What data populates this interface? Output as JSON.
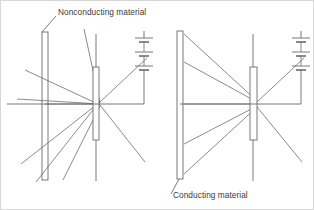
{
  "figure": {
    "title_label_top": "Nonconducting material",
    "title_label_bottom": "Conducting material",
    "line_color": "#59595b",
    "plate_color": "#6a6a6c",
    "text_color": "#3a3a3a",
    "background": "#ffffff"
  },
  "annotations": {
    "top": {
      "text": "Nonconducting material",
      "x": 57,
      "y": 12,
      "leader_from_x": 55,
      "leader_from_y": 15,
      "leader_to_x": 41,
      "leader_to_y": 31
    },
    "bottom": {
      "text": "Conducting material",
      "x": 172,
      "y": 197,
      "leader_from_x": 170,
      "leader_from_y": 193,
      "leader_to_x": 177,
      "leader_to_y": 178
    }
  },
  "panels": [
    {
      "name": "nonconducting-panel",
      "plate_type": "nonconducting",
      "plate_label": "Nonconducting material",
      "field_lines_pass_through": true,
      "slab": {
        "x": 41,
        "y": 31,
        "width": 6,
        "height": 148
      },
      "aperture_plate": {
        "x": 92,
        "y": 66,
        "width": 6,
        "height": 73
      },
      "aperture_stem_top": {
        "x": 95,
        "y": 33,
        "y2": 66
      },
      "aperture_stem_bottom": {
        "x": 95,
        "y": 139,
        "y2": 180
      },
      "wire": {
        "x1": 44,
        "y1": 103,
        "x2": 143,
        "y2": 103,
        "drop_x": 143,
        "drop_y2": 79
      },
      "battery": {
        "x": 140,
        "y_top": 37,
        "y_bottom": 79,
        "cells": 3
      },
      "field_lines": [
        {
          "x1": 35,
          "y1": 181,
          "x2": 99,
          "y2": 100
        },
        {
          "x1": 20,
          "y1": 163,
          "x2": 99,
          "y2": 101
        },
        {
          "x1": 16,
          "y1": 98,
          "x2": 99,
          "y2": 103
        },
        {
          "x1": 24,
          "y1": 69,
          "x2": 99,
          "y2": 104
        },
        {
          "x1": 62,
          "y1": 179,
          "x2": 99,
          "y2": 105
        },
        {
          "x1": 83,
          "y1": 28,
          "x2": 99,
          "y2": 102
        },
        {
          "x1": 99,
          "y1": 101,
          "x2": 146,
          "y2": 57
        },
        {
          "x1": 99,
          "y1": 104,
          "x2": 144,
          "y2": 161
        }
      ]
    },
    {
      "name": "conducting-panel",
      "plate_type": "conducting",
      "plate_label": "Conducting material",
      "field_lines_pass_through": false,
      "slab": {
        "x": 176,
        "y": 30,
        "width": 6,
        "height": 148
      },
      "aperture_plate": {
        "x": 249,
        "y": 66,
        "width": 7,
        "height": 73
      },
      "aperture_stem_top": {
        "x": 252,
        "y": 33,
        "y2": 66
      },
      "aperture_stem_bottom": {
        "x": 252,
        "y": 139,
        "y2": 180
      },
      "wire": {
        "x1": 179,
        "y1": 103,
        "x2": 300,
        "y2": 103,
        "drop_x": 300,
        "drop_y2": 79
      },
      "battery": {
        "x": 297,
        "y_top": 37,
        "y_bottom": 79,
        "cells": 3
      },
      "field_lines": [
        {
          "x1": 183,
          "y1": 33,
          "x2": 256,
          "y2": 100
        },
        {
          "x1": 183,
          "y1": 61,
          "x2": 256,
          "y2": 101
        },
        {
          "x1": 183,
          "y1": 103,
          "x2": 256,
          "y2": 103
        },
        {
          "x1": 183,
          "y1": 143,
          "x2": 256,
          "y2": 105
        },
        {
          "x1": 183,
          "y1": 173,
          "x2": 256,
          "y2": 106
        },
        {
          "x1": 256,
          "y1": 101,
          "x2": 303,
          "y2": 57
        },
        {
          "x1": 256,
          "y1": 106,
          "x2": 301,
          "y2": 161
        }
      ]
    }
  ]
}
